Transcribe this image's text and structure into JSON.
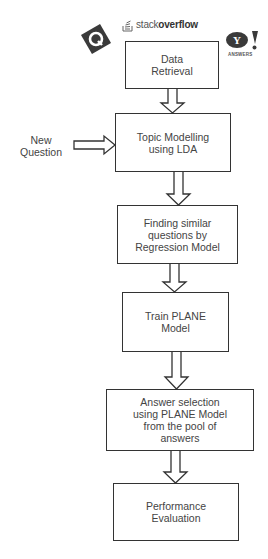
{
  "diagram": {
    "type": "flowchart",
    "logos": {
      "quora": "Q",
      "stackoverflow": {
        "prefix": "stack",
        "suffix": "overflow"
      },
      "yahoo": {
        "mark": "Y!",
        "caption": "ANSWERS"
      }
    },
    "side_input": {
      "label_line1": "New",
      "label_line2": "Question"
    },
    "steps": [
      {
        "id": "data-retrieval",
        "lines": [
          "Data",
          "Retrieval"
        ]
      },
      {
        "id": "topic-modelling",
        "lines": [
          "Topic Modelling",
          "using LDA"
        ]
      },
      {
        "id": "finding-similar",
        "lines": [
          "Finding similar",
          "questions by",
          "Regression Model"
        ]
      },
      {
        "id": "train-plane",
        "lines": [
          "Train PLANE",
          "Model"
        ]
      },
      {
        "id": "answer-selection",
        "lines": [
          "Answer selection",
          "using PLANE Model",
          "from the pool of",
          "answers"
        ]
      },
      {
        "id": "performance-evaluation",
        "lines": [
          "Performance",
          "Evaluation"
        ]
      }
    ],
    "colors": {
      "stroke": "#333333",
      "text": "#444444",
      "logo_dark": "#3a3a3a",
      "background": "#ffffff"
    }
  }
}
